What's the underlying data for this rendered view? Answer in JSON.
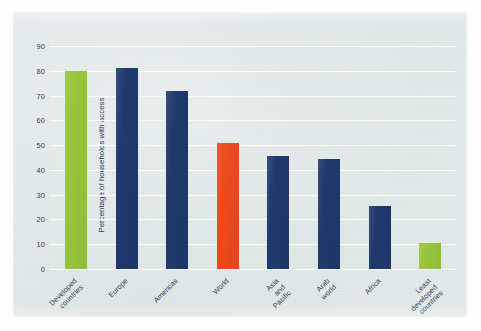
{
  "chart_data": {
    "type": "bar",
    "title": "",
    "subtitle": "",
    "xlabel": "",
    "ylabel": "Percentage of households with access",
    "categories": [
      "Developed\ncountries",
      "Europe",
      "Americas",
      "World",
      "Asia\nand\nPacific",
      "Arab\nworld",
      "Africa",
      "Least\ndeveloped\ncountries"
    ],
    "values": [
      80,
      81,
      72,
      51,
      45.5,
      44.5,
      25.5,
      10.5
    ],
    "bar_colors": [
      "#9AC63C",
      "#20396F",
      "#20396F",
      "#EF4A1E",
      "#20396F",
      "#20396F",
      "#20396F",
      "#9AC63C"
    ],
    "ylim": [
      0,
      90
    ],
    "yticks": [
      0,
      10,
      20,
      30,
      40,
      50,
      60,
      70,
      80,
      90
    ],
    "ytick_labels": [
      "0",
      "10",
      "20",
      "30",
      "40",
      "50",
      "60",
      "70",
      "80",
      "90"
    ],
    "grid": true,
    "gridline_color": "#fbfdfd",
    "legend": null,
    "legend_position": "none",
    "plot_background": "#e2e8e8",
    "figure_background": "#fdfdfd",
    "axis_text_color": "#2b4158"
  }
}
